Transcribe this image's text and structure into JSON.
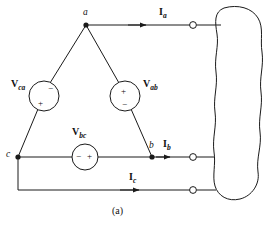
{
  "figure": {
    "caption": "(a)",
    "stroke_color": "#1a1a1a",
    "background_color": "#ffffff"
  },
  "nodes": [
    {
      "id": "a",
      "label": "a",
      "x": 86,
      "y": 25
    },
    {
      "id": "b",
      "label": "b",
      "x": 152,
      "y": 157
    },
    {
      "id": "c",
      "label": "c",
      "x": 18,
      "y": 157
    }
  ],
  "sources": [
    {
      "id": "v_ca",
      "label": "V",
      "subscript": "ca",
      "cx": 44,
      "cy": 96,
      "r": 15,
      "plus": "+",
      "minus": "−",
      "plus_position": "bottom-left",
      "minus_position": "top-right"
    },
    {
      "id": "v_ab",
      "label": "V",
      "subscript": "ab",
      "cx": 125,
      "cy": 96,
      "r": 15,
      "plus": "+",
      "minus": "−",
      "plus_position": "top",
      "minus_position": "bottom"
    },
    {
      "id": "v_bc",
      "label": "V",
      "subscript": "bc",
      "cx": 85,
      "cy": 157,
      "r": 13,
      "plus": "+",
      "minus": "−",
      "plus_position": "right",
      "minus_position": "left"
    }
  ],
  "currents": [
    {
      "id": "i_a",
      "label": "I",
      "subscript": "a",
      "label_x": 159,
      "label_y": 8,
      "arrow_x": 150,
      "arrow_y": 25
    },
    {
      "id": "i_b",
      "label": "I",
      "subscript": "b",
      "label_x": 178,
      "label_y": 140,
      "arrow_x": 172,
      "arrow_y": 157
    },
    {
      "id": "i_c",
      "label": "I",
      "subscript": "c",
      "label_x": 138,
      "label_y": 172,
      "arrow_x": 140,
      "arrow_y": 190
    }
  ],
  "terminals": [
    {
      "id": "terminal-a",
      "cx": 193,
      "cy": 25,
      "r": 3.4
    },
    {
      "id": "terminal-b",
      "cx": 193,
      "cy": 157,
      "r": 3.4
    },
    {
      "id": "terminal-c",
      "cx": 193,
      "cy": 190,
      "r": 3.4
    }
  ],
  "load_blob": {
    "id": "load-network",
    "path": "M 224 8 C 238 4 252 8 258 18 C 264 28 260 40 262 52 C 264 66 259 78 261 92 C 263 106 258 118 260 132 C 262 146 256 158 258 172 C 260 184 252 196 240 199 C 228 202 218 196 215 186 C 212 176 216 164 214 152 C 212 138 217 126 215 112 C 213 98 218 86 216 72 C 214 58 219 46 217 34 C 215 22 214 12 224 8 Z"
  },
  "wires": {
    "delta_ac": "from node a down-left to node c through V_ca",
    "delta_ab": "from node a down-right to node b through V_ab",
    "delta_cb": "from node c right to node b through V_bc",
    "line_a": "from node a right to terminal-a",
    "line_b": "from node b right to terminal-b",
    "line_c": "from node c down then right to terminal-c"
  }
}
